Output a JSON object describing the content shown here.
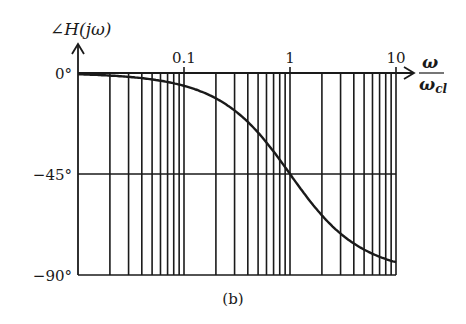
{
  "figure": {
    "caption": "(b)",
    "ylabel": "∠H(jω)",
    "xlabel_num": "ω",
    "xlabel_den": "ω",
    "xlabel_den_sub": "cl"
  },
  "chart_data": {
    "type": "line",
    "title": "",
    "ylabel": "∠H(jω)",
    "xlabel": "ω/ω_cl",
    "xscale": "log",
    "xlim": [
      0.01,
      10
    ],
    "ylim": [
      -90,
      0
    ],
    "x_tick_labels": [
      "0.1",
      "1",
      "10"
    ],
    "x_ticks": [
      0.1,
      1,
      10
    ],
    "y_tick_labels": [
      "0°",
      "−45°",
      "−90°"
    ],
    "y_ticks": [
      0,
      -45,
      -90
    ],
    "grid": {
      "x": "log-minor (1..9 per decade)",
      "y": [
        0,
        -45,
        -90
      ]
    },
    "series": [
      {
        "name": "phase",
        "description": "first-order low-pass phase: −arctan(ω/ω_cl)",
        "x": [
          0.01,
          0.02,
          0.05,
          0.1,
          0.2,
          0.3,
          0.5,
          0.7,
          1,
          1.5,
          2,
          3,
          5,
          7,
          10
        ],
        "values": [
          -0.6,
          -1.1,
          -2.9,
          -5.7,
          -11.3,
          -16.7,
          -26.6,
          -35.0,
          -45.0,
          -56.3,
          -63.4,
          -71.6,
          -78.7,
          -81.9,
          -84.3
        ]
      }
    ],
    "legend": null,
    "annotations": [
      "(b)"
    ]
  },
  "style": {
    "ink": "#1a1a1a",
    "background": "#ffffff"
  }
}
